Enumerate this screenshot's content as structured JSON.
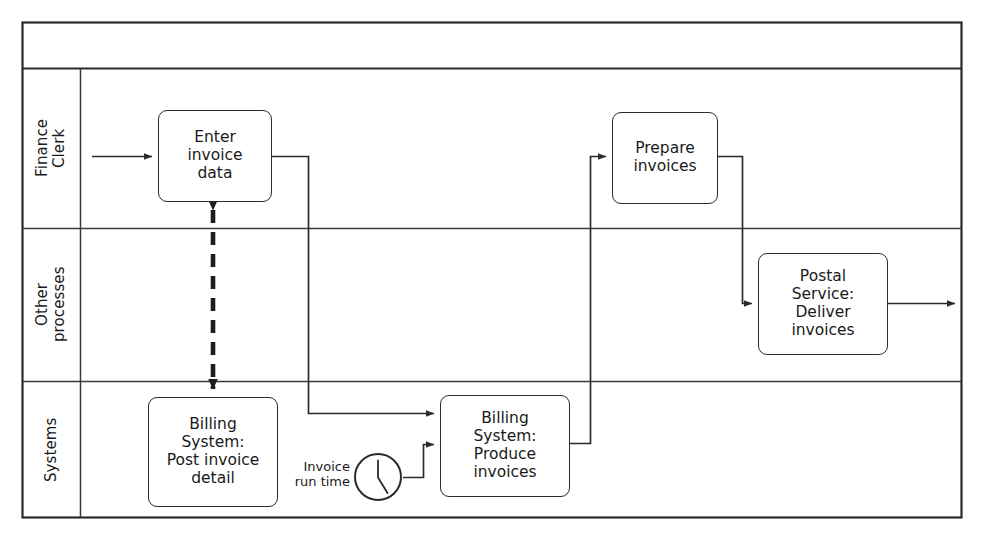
{
  "diagram": {
    "type": "bpmn-swimlane",
    "title": "",
    "pool_header": "",
    "stroke_color": "#2b2b2b",
    "lane_border_color": "#3a3a3a",
    "background": "#ffffff",
    "lanes": [
      {
        "id": "finance-clerk",
        "label": "Finance\nClerk"
      },
      {
        "id": "other-processes",
        "label": "Other\nprocesses"
      },
      {
        "id": "systems",
        "label": "Systems"
      }
    ],
    "tasks": [
      {
        "id": "enter-invoice-data",
        "lane": "finance-clerk",
        "label": "Enter\ninvoice\ndata"
      },
      {
        "id": "prepare-invoices",
        "lane": "finance-clerk",
        "label": "Prepare\ninvoices"
      },
      {
        "id": "postal-service",
        "lane": "other-processes",
        "label": "Postal\nService:\nDeliver\ninvoices"
      },
      {
        "id": "post-invoice-detail",
        "lane": "systems",
        "label": "Billing\nSystem:\nPost invoice\ndetail"
      },
      {
        "id": "produce-invoices",
        "lane": "systems",
        "label": "Billing\nSystem:\nProduce\ninvoices"
      }
    ],
    "events": [
      {
        "id": "invoice-run-time",
        "lane": "systems",
        "kind": "timer-event",
        "label": "Invoice\nrun time"
      }
    ],
    "flows": [
      {
        "id": "start-to-enter",
        "from": "start",
        "to": "enter-invoice-data",
        "style": "sequence"
      },
      {
        "id": "enter-to-produce",
        "from": "enter-invoice-data",
        "to": "produce-invoices",
        "style": "sequence"
      },
      {
        "id": "timer-to-produce",
        "from": "invoice-run-time",
        "to": "produce-invoices",
        "style": "sequence"
      },
      {
        "id": "produce-to-prepare",
        "from": "produce-invoices",
        "to": "prepare-invoices",
        "style": "sequence"
      },
      {
        "id": "prepare-to-postal",
        "from": "prepare-invoices",
        "to": "postal-service",
        "style": "sequence"
      },
      {
        "id": "postal-to-end",
        "from": "postal-service",
        "to": "end",
        "style": "sequence"
      },
      {
        "id": "enter-detail-assoc",
        "from": "enter-invoice-data",
        "to": "post-invoice-detail",
        "style": "dashed-bidirectional"
      }
    ]
  }
}
